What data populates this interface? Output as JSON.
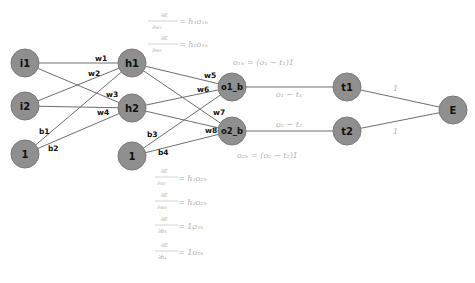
{
  "diagram": {
    "nodes": [
      {
        "id": "i1",
        "label": "i1",
        "x": 25,
        "y": 63
      },
      {
        "id": "i2",
        "label": "i2",
        "x": 25,
        "y": 106
      },
      {
        "id": "bias1",
        "label": "1",
        "x": 25,
        "y": 154
      },
      {
        "id": "h1",
        "label": "h1",
        "x": 132,
        "y": 63
      },
      {
        "id": "h2",
        "label": "h2",
        "x": 132,
        "y": 108
      },
      {
        "id": "bias2",
        "label": "1",
        "x": 132,
        "y": 156
      },
      {
        "id": "o1_b",
        "label": "o1_b",
        "x": 232,
        "y": 87
      },
      {
        "id": "o2_b",
        "label": "o2_b",
        "x": 232,
        "y": 131
      },
      {
        "id": "t1",
        "label": "t1",
        "x": 347,
        "y": 87
      },
      {
        "id": "t2",
        "label": "t2",
        "x": 347,
        "y": 131
      },
      {
        "id": "E",
        "label": "E",
        "x": 453,
        "y": 110
      }
    ],
    "edges": [
      {
        "from": "i1",
        "to": "h1",
        "label": "w1"
      },
      {
        "from": "i1",
        "to": "h2",
        "label": "w3"
      },
      {
        "from": "i2",
        "to": "h1",
        "label": "w2"
      },
      {
        "from": "i2",
        "to": "h2",
        "label": "w4"
      },
      {
        "from": "bias1",
        "to": "h1",
        "label": "b1"
      },
      {
        "from": "bias1",
        "to": "h2",
        "label": "b2"
      },
      {
        "from": "h1",
        "to": "o1_b",
        "label": "w5"
      },
      {
        "from": "h1",
        "to": "o2_b",
        "label": "w7"
      },
      {
        "from": "h2",
        "to": "o1_b",
        "label": "w6"
      },
      {
        "from": "h2",
        "to": "o2_b",
        "label": "w8"
      },
      {
        "from": "bias2",
        "to": "o1_b",
        "label": "b3"
      },
      {
        "from": "bias2",
        "to": "o2_b",
        "label": "b4"
      },
      {
        "from": "o1_b",
        "to": "t1",
        "label": "o1 − t1"
      },
      {
        "from": "o2_b",
        "to": "t2",
        "label": "o2 − t2"
      },
      {
        "from": "t1",
        "to": "E",
        "label": "1"
      },
      {
        "from": "t2",
        "to": "E",
        "label": "1"
      }
    ],
    "edge_labels": {
      "w1": "w1",
      "w2": "w2",
      "w3": "w3",
      "w4": "w4",
      "w5": "w5",
      "w6": "w6",
      "w7": "w7",
      "w8": "w8",
      "b1": "b1",
      "b2": "b2",
      "b3": "b3",
      "b4": "b4",
      "o1_t1": "o₁ − t₁",
      "o2_t2": "o₂ − t₂",
      "t1_E": "1",
      "t2_E": "1"
    },
    "node_deltas": {
      "o1b": "o₁ₕ = (o₁ − t₁)1",
      "o2b": "o₂ₕ = (o₂ − t₂)1"
    },
    "gradients_top": [
      {
        "num": "∂E",
        "den": "∂w₅",
        "rhs": "= h₁o₁ₕ"
      },
      {
        "num": "∂E",
        "den": "∂w₆",
        "rhs": "= h₂o₁ₕ"
      }
    ],
    "gradients_bottom": [
      {
        "num": "∂E",
        "den": "∂w₇",
        "rhs": "= h₁o₂ₕ"
      },
      {
        "num": "∂E",
        "den": "∂w₈",
        "rhs": "= h₂o₂ₕ"
      },
      {
        "num": "∂E",
        "den": "∂b₃",
        "rhs": "= 1o₁ₕ"
      },
      {
        "num": "∂E",
        "den": "∂b₄",
        "rhs": "= 1o₂ₕ"
      }
    ],
    "colors": {
      "node_fill": "#8f8f8f",
      "edge": "#6e6e6e",
      "math_text": "#b0b0b0",
      "background": "#ffffff"
    }
  }
}
